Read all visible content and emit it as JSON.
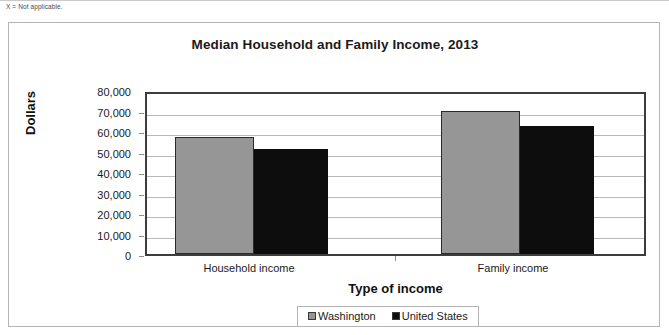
{
  "page": {
    "footnote": "X = Not applicable."
  },
  "chart_data": {
    "type": "bar",
    "title": "Median Household and Family Income, 2013",
    "xlabel": "Type of income",
    "ylabel": "Dollars",
    "categories": [
      "Household income",
      "Family income"
    ],
    "series": [
      {
        "name": "Washington",
        "color": "#969696",
        "values": [
          58500,
          71500
        ]
      },
      {
        "name": "United States",
        "color": "#0d0d0d",
        "values": [
          52300,
          64000
        ]
      }
    ],
    "ylim": [
      0,
      80000
    ],
    "ytick_step": 10000,
    "ytick_labels": [
      "80,000",
      "70,000",
      "60,000",
      "50,000",
      "40,000",
      "30,000",
      "20,000",
      "10,000",
      "0"
    ],
    "ytick_values": [
      80000,
      70000,
      60000,
      50000,
      40000,
      30000,
      20000,
      10000,
      0
    ],
    "grid": true,
    "legend_position": "bottom"
  }
}
